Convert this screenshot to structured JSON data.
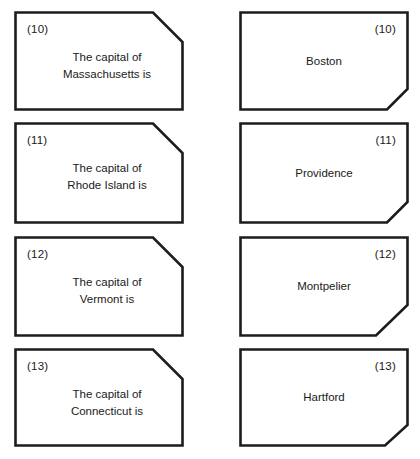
{
  "worksheet": {
    "title": "State capitals matching worksheet",
    "rows": [
      {
        "number": "(10)",
        "prompt_lines": [
          "The capital of",
          "Massachusetts is"
        ],
        "answer": "Boston",
        "prompt_notch": "top-right",
        "answer_notch": "bottom-right"
      },
      {
        "number": "(11)",
        "prompt_lines": [
          "The capital of",
          "Rhode Island is"
        ],
        "answer": "Providence",
        "prompt_notch": "top-right",
        "answer_notch": "bottom-right"
      },
      {
        "number": "(12)",
        "prompt_lines": [
          "The capital of",
          "Vermont is"
        ],
        "answer": "Montpelier",
        "prompt_notch": "top-right",
        "answer_notch": "bottom-right"
      },
      {
        "number": "(13)",
        "prompt_lines": [
          "The capital of",
          "Connecticut is"
        ],
        "answer": "Hartford",
        "prompt_notch": "top-right",
        "answer_notch": "bottom-right"
      }
    ]
  },
  "style": {
    "ink": "#1c1c1c",
    "paper": "#ffffff"
  }
}
